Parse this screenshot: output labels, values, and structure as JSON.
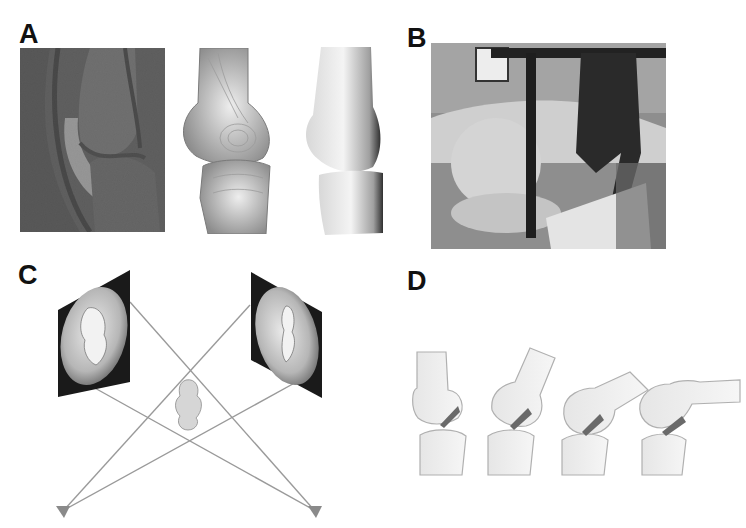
{
  "figure": {
    "panels": [
      {
        "id": "A",
        "label": "A",
        "description": "Sagittal MRI of knee, segmented 3D bone surface, smoothed 3D bone model"
      },
      {
        "id": "B",
        "label": "B",
        "description": "Photo of dual fluoroscopic imaging setup with subject"
      },
      {
        "id": "C",
        "label": "C",
        "description": "Virtual fluoroscopy: two image intensifier planes, two X-ray sources, 3D knee model"
      },
      {
        "id": "D",
        "label": "D",
        "description": "Knee models at four flexion angles"
      }
    ],
    "colors": {
      "background": "#ffffff",
      "label": "#111111",
      "ray_lines": "#9a9a9a",
      "source": "#8a8a8a",
      "plane_frame": "#1a1a1a",
      "bone": "#e8e8e8",
      "mri": "#5a5a5a"
    },
    "panel_d": {
      "flexion_count": 4
    }
  }
}
